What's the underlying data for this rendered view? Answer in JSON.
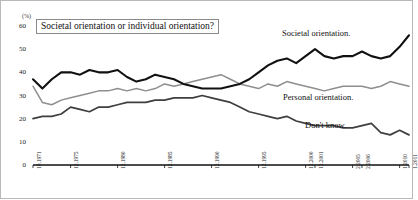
{
  "chart_data": {
    "type": "line",
    "title": "Societal orientation or individual orientation?",
    "unit_label": "(%)",
    "xlabel": "",
    "ylabel": "",
    "ylim": [
      0,
      60
    ],
    "yticks": [
      0,
      10,
      20,
      30,
      40,
      50,
      60
    ],
    "grid": false,
    "legend_position": "inline-right",
    "xtick_labels": [
      "10.1971",
      "12.1975",
      "12.1980",
      "12.1985",
      "12.1990",
      "12.1995",
      "12.2000",
      "12.2001",
      "2.2005",
      "2.2006",
      "1.2010",
      "1.2011"
    ],
    "x_index": [
      0,
      4,
      9,
      14,
      19,
      24,
      29,
      30,
      34,
      35,
      39,
      40
    ],
    "x": [
      "10.1971",
      "12.1972",
      "12.1973",
      "12.1974",
      "12.1975",
      "12.1976",
      "12.1977",
      "12.1978",
      "12.1979",
      "12.1980",
      "12.1981",
      "12.1982",
      "12.1983",
      "12.1984",
      "12.1985",
      "12.1986",
      "12.1987",
      "12.1988",
      "12.1989",
      "12.1990",
      "12.1991",
      "12.1992",
      "12.1993",
      "12.1994",
      "12.1995",
      "12.1996",
      "12.1997",
      "12.1998",
      "12.1999",
      "12.2000",
      "12.2001",
      "12.2002",
      "12.2003",
      "12.2004",
      "2.2005",
      "2.2006",
      "2.2007",
      "2.2008",
      "2.2009",
      "1.2010",
      "1.2011"
    ],
    "series": [
      {
        "name": "Societal orientation.",
        "color": "#111111",
        "width": 2.1,
        "values": [
          37,
          33,
          37,
          40,
          40,
          39,
          41,
          40,
          40,
          41,
          38,
          36,
          37,
          39,
          38,
          37,
          35,
          34,
          33,
          33,
          33,
          34,
          35,
          37,
          40,
          43,
          45,
          46,
          44,
          47,
          50,
          47,
          46,
          47,
          47,
          49,
          47,
          46,
          47,
          51,
          56
        ]
      },
      {
        "name": "Personal orientation.",
        "color": "#8e8e8e",
        "width": 1.5,
        "values": [
          34,
          27,
          26,
          28,
          29,
          30,
          31,
          32,
          32,
          33,
          32,
          33,
          32,
          33,
          35,
          34,
          35,
          36,
          37,
          38,
          39,
          37,
          35,
          34,
          33,
          35,
          34,
          36,
          35,
          34,
          33,
          32,
          33,
          34,
          34,
          34,
          33,
          34,
          36,
          35,
          34
        ]
      },
      {
        "name": "Don't know.",
        "color": "#3f3f3f",
        "width": 1.7,
        "values": [
          20,
          21,
          21,
          22,
          25,
          24,
          23,
          25,
          25,
          26,
          27,
          27,
          27,
          28,
          28,
          29,
          29,
          29,
          30,
          29,
          28,
          27,
          25,
          23,
          22,
          21,
          20,
          21,
          19,
          18,
          17,
          17,
          17,
          16,
          16,
          17,
          18,
          14,
          13,
          15,
          13
        ]
      }
    ],
    "annotations": [
      {
        "text": "Societal orientation.",
        "x_px": 282,
        "y_px": 28
      },
      {
        "text": "Personal orientation.",
        "x_px": 283,
        "y_px": 92
      },
      {
        "text": "Don't know.",
        "x_px": 305,
        "y_px": 120
      }
    ]
  }
}
